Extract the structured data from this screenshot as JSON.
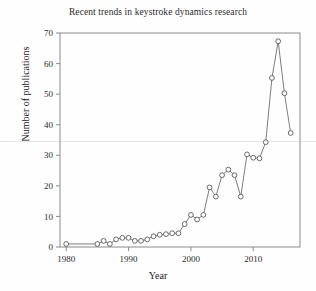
{
  "chart_data": {
    "type": "line",
    "title": "Recent trends in keystroke dynamics research",
    "xlabel": "Year",
    "ylabel": "Number of publications",
    "xlim": [
      1979,
      1997
    ],
    "ylim": [
      0,
      70
    ],
    "xlim_actual": [
      1979,
      1997
    ],
    "x_range": [
      1979,
      2017.5
    ],
    "y_range": [
      0,
      70
    ],
    "xticks": [
      1980,
      1990,
      2000,
      2010
    ],
    "xtick_labels": [
      "1980",
      "1990",
      "2000",
      "2010"
    ],
    "x_minor_ticks": [
      1985,
      1995,
      2005,
      2015
    ],
    "yticks": [
      0,
      10,
      20,
      30,
      40,
      50,
      60,
      70
    ],
    "ytick_labels": [
      "0",
      "10",
      "20",
      "30",
      "40",
      "50",
      "60",
      "70"
    ],
    "grid": false,
    "legend": null,
    "marker": "open-circle",
    "line_color": "#6e6e6e",
    "marker_edge_color": "#5a5a5a",
    "marker_face_color": "#ffffff",
    "x": [
      1980,
      1985,
      1986,
      1987,
      1988,
      1989,
      1990,
      1991,
      1992,
      1993,
      1994,
      1995,
      1996,
      1997,
      1998,
      1999,
      2000,
      2001,
      2002,
      2003,
      2004,
      2005,
      2006,
      2007,
      2008,
      2009,
      2010,
      2011,
      2012,
      2013,
      2014,
      2015,
      2016
    ],
    "values": [
      1.0,
      1.0,
      2.0,
      1.0,
      2.5,
      3.0,
      3.0,
      2.0,
      2.0,
      2.5,
      3.5,
      4.0,
      4.2,
      4.5,
      4.5,
      7.5,
      10.5,
      9.0,
      10.5,
      19.5,
      16.5,
      23.5,
      25.3,
      23.5,
      16.5,
      30.3,
      29.2,
      29.0,
      34.3,
      55.3,
      67.3,
      50.3,
      37.3
    ],
    "series": [
      {
        "name": "Number of publications",
        "values": [
          1.0,
          1.0,
          2.0,
          1.0,
          2.5,
          3.0,
          3.0,
          2.0,
          2.0,
          2.5,
          3.5,
          4.0,
          4.2,
          4.5,
          4.5,
          7.5,
          10.5,
          9.0,
          10.5,
          19.5,
          16.5,
          23.5,
          25.3,
          23.5,
          16.5,
          30.3,
          29.2,
          29.0,
          34.3,
          55.3,
          67.3,
          50.3,
          37.3
        ]
      }
    ]
  },
  "axes": {
    "frame_color": "#7a7a7a"
  }
}
